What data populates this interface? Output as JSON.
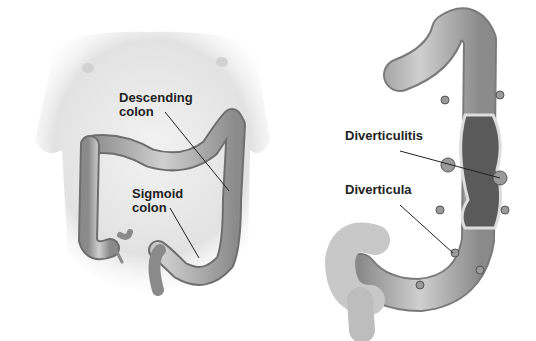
{
  "figure": {
    "left_panel": {
      "name": "abdomen-colon-overview",
      "labels": [
        {
          "id": "descending",
          "line1": "Descending",
          "line2": "colon"
        },
        {
          "id": "sigmoid",
          "line1": "Sigmoid",
          "line2": "colon"
        }
      ]
    },
    "right_panel": {
      "name": "colon-cutaway-diverticula",
      "labels": [
        {
          "id": "diverticulitis",
          "text": "Diverticulitis"
        },
        {
          "id": "diverticula",
          "text": "Diverticula"
        }
      ]
    },
    "colors": {
      "skin": "#e9e9e9",
      "skin_shadow": "#cfcfcf",
      "colon": "#b8b8b8",
      "colon_dark": "#7a7a7a",
      "lumen": "#5a5a5a",
      "leader_line": "#222222"
    }
  }
}
